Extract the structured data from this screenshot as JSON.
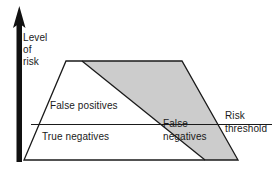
{
  "diagram": {
    "axis": {
      "name": "vertical-risk-axis",
      "label_lines": [
        "Level",
        "of",
        "risk"
      ],
      "label_text": "Level of risk",
      "arrow_direction": "up"
    },
    "regions": [
      {
        "id": "false-positives",
        "label": "False positives",
        "fill": "#ffffff"
      },
      {
        "id": "true-negatives",
        "label": "True negatives",
        "fill": "#ffffff"
      },
      {
        "id": "false-negatives",
        "label_lines": [
          "False",
          "negatives"
        ],
        "label": "False negatives",
        "fill": "#cccccc"
      }
    ],
    "threshold": {
      "label_lines": [
        "Risk",
        "threshold"
      ],
      "label": "Risk threshold",
      "line_name": "risk-threshold-line"
    },
    "colors": {
      "stroke": "#1a1a1a",
      "shaded_fill": "#cccccc",
      "plain_fill": "#ffffff",
      "background": "#ffffff",
      "text": "#1a1a1a"
    },
    "geometry": {
      "trapezoid": "66,61 182,61 238,160 24,160",
      "shaded_wedge": "82,61 182,61 238,160 205,160",
      "diagonal": "82,61 205,160",
      "threshold_line_y": 124.5,
      "threshold_line_x1": 31,
      "threshold_line_x2": 272,
      "axis_x": 19.5,
      "axis_top": 8,
      "axis_bottom": 162
    }
  }
}
